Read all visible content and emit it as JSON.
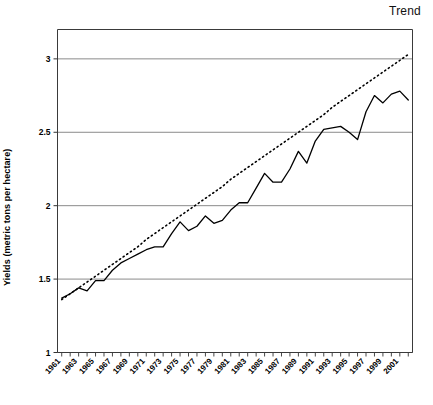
{
  "chart_data": {
    "type": "line",
    "title": "",
    "xlabel": "",
    "ylabel": "Yields (metric tons per hectare)",
    "ylim": [
      1,
      3.2
    ],
    "yticks": [
      1,
      1.5,
      2,
      2.5,
      3
    ],
    "ytick_labels": [
      "1",
      "1.5",
      "2",
      "2.5",
      "3"
    ],
    "grid": "horizontal",
    "legend_position": "top-right",
    "x": [
      1961,
      1962,
      1963,
      1964,
      1965,
      1966,
      1967,
      1968,
      1969,
      1970,
      1971,
      1972,
      1973,
      1974,
      1975,
      1976,
      1977,
      1978,
      1979,
      1980,
      1981,
      1982,
      1983,
      1984,
      1985,
      1986,
      1987,
      1988,
      1989,
      1990,
      1991,
      1992,
      1993,
      1994,
      1995,
      1996,
      1997,
      1998,
      1999,
      2000,
      2001,
      2002
    ],
    "xtick_labels": [
      "1961",
      "1963",
      "1965",
      "1967",
      "1969",
      "1971",
      "1973",
      "1975",
      "1977",
      "1979",
      "1981",
      "1983",
      "1985",
      "1987",
      "1989",
      "1991",
      "1993",
      "1995",
      "1997",
      "1999",
      "2001"
    ],
    "series": [
      {
        "name": "Yields",
        "style": "solid",
        "color": "#000000",
        "values": [
          1.37,
          1.4,
          1.44,
          1.42,
          1.49,
          1.49,
          1.56,
          1.61,
          1.64,
          1.67,
          1.7,
          1.72,
          1.72,
          1.81,
          1.89,
          1.83,
          1.86,
          1.93,
          1.88,
          1.9,
          1.97,
          2.02,
          2.02,
          2.12,
          2.22,
          2.16,
          2.16,
          2.25,
          2.37,
          2.29,
          2.44,
          2.52,
          2.53,
          2.54,
          2.5,
          2.45,
          2.64,
          2.75,
          2.7,
          2.76,
          2.78,
          2.72
        ]
      },
      {
        "name": "Trend",
        "style": "dotted",
        "color": "#000000",
        "description": "linear trend line fitted through yields",
        "values": [
          1.36,
          1.4,
          1.44,
          1.48,
          1.52,
          1.56,
          1.6,
          1.64,
          1.68,
          1.72,
          1.77,
          1.81,
          1.85,
          1.89,
          1.93,
          1.97,
          2.01,
          2.05,
          2.09,
          2.13,
          2.18,
          2.22,
          2.26,
          2.3,
          2.34,
          2.38,
          2.42,
          2.46,
          2.5,
          2.54,
          2.58,
          2.62,
          2.67,
          2.71,
          2.75,
          2.79,
          2.83,
          2.87,
          2.91,
          2.95,
          2.99,
          3.03
        ]
      }
    ]
  },
  "legend": {
    "trend_label": "Trend"
  },
  "axes": {
    "y_title": "Yields (metric tons per hectare)"
  }
}
